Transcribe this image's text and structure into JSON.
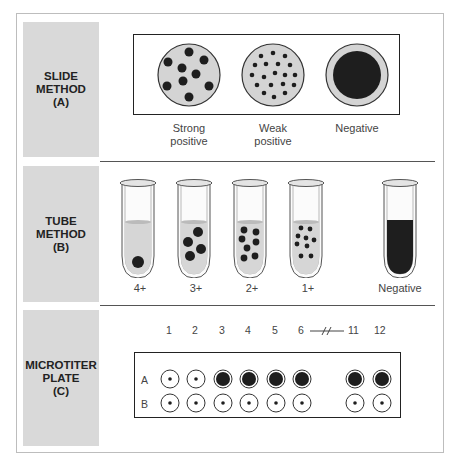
{
  "figure": {
    "sections": [
      {
        "id": "A",
        "label": "SLIDE\nMETHOD\n(A)",
        "results": [
          {
            "caption": "Strong\npositive",
            "pattern": "large-clumps"
          },
          {
            "caption": "Weak\npositive",
            "pattern": "small-clumps"
          },
          {
            "caption": "Negative",
            "pattern": "uniform"
          }
        ]
      },
      {
        "id": "B",
        "label": "TUBE\nMETHOD\n(B)",
        "results": [
          {
            "caption": "4+",
            "pattern": "single-button"
          },
          {
            "caption": "3+",
            "pattern": "several-large"
          },
          {
            "caption": "2+",
            "pattern": "many-medium"
          },
          {
            "caption": "1+",
            "pattern": "many-small"
          },
          {
            "caption": "Negative",
            "pattern": "uniform-dark"
          }
        ]
      },
      {
        "id": "C",
        "label": "MICROTITER\nPLATE\n(C)",
        "columns": [
          "1",
          "2",
          "3",
          "4",
          "5",
          "6",
          "11",
          "12"
        ],
        "break_symbol": "—//—",
        "rows": [
          {
            "name": "A",
            "wells": [
              "dot",
              "dot",
              "filled",
              "filled",
              "filled",
              "filled",
              "filled",
              "filled"
            ]
          },
          {
            "name": "B",
            "wells": [
              "dot",
              "dot",
              "dot",
              "dot",
              "dot",
              "dot",
              "dot",
              "dot"
            ]
          }
        ]
      }
    ]
  },
  "colors": {
    "panel": "#d9d9d9",
    "slide_fill": "#d4d4d4",
    "dark": "#1e1e1e",
    "tube_liquid": "#d6d6d6"
  }
}
